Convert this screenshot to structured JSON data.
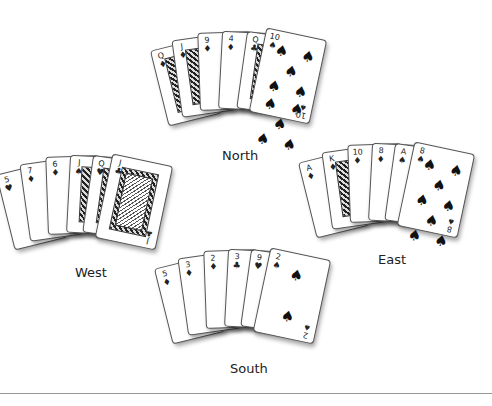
{
  "table": {
    "background": "#ffffff",
    "card_ink": "#111111"
  },
  "hands": [
    {
      "seat": "North",
      "label": "North",
      "cards": [
        {
          "rank": "Q",
          "suit": "♦",
          "suit_name": "diamonds"
        },
        {
          "rank": "J",
          "suit": "♦",
          "suit_name": "diamonds"
        },
        {
          "rank": "9",
          "suit": "♦",
          "suit_name": "diamonds"
        },
        {
          "rank": "4",
          "suit": "♦",
          "suit_name": "diamonds"
        },
        {
          "rank": "Q",
          "suit": "♣",
          "suit_name": "clubs"
        },
        {
          "rank": "10",
          "suit": "♠",
          "suit_name": "spades"
        }
      ]
    },
    {
      "seat": "West",
      "label": "West",
      "cards": [
        {
          "rank": "5",
          "suit": "♥",
          "suit_name": "hearts"
        },
        {
          "rank": "7",
          "suit": "♦",
          "suit_name": "diamonds"
        },
        {
          "rank": "6",
          "suit": "♦",
          "suit_name": "diamonds"
        },
        {
          "rank": "J",
          "suit": "♠",
          "suit_name": "spades"
        },
        {
          "rank": "Q",
          "suit": "♥",
          "suit_name": "hearts"
        },
        {
          "rank": "J",
          "suit": "♣",
          "suit_name": "clubs"
        }
      ]
    },
    {
      "seat": "East",
      "label": "East",
      "cards": [
        {
          "rank": "A",
          "suit": "♦",
          "suit_name": "diamonds"
        },
        {
          "rank": "K",
          "suit": "♦",
          "suit_name": "diamonds"
        },
        {
          "rank": "10",
          "suit": "♦",
          "suit_name": "diamonds"
        },
        {
          "rank": "8",
          "suit": "♦",
          "suit_name": "diamonds"
        },
        {
          "rank": "A",
          "suit": "♠",
          "suit_name": "spades"
        },
        {
          "rank": "8",
          "suit": "♠",
          "suit_name": "spades"
        }
      ]
    },
    {
      "seat": "South",
      "label": "South",
      "cards": [
        {
          "rank": "5",
          "suit": "♦",
          "suit_name": "diamonds"
        },
        {
          "rank": "3",
          "suit": "♦",
          "suit_name": "diamonds"
        },
        {
          "rank": "2",
          "suit": "♦",
          "suit_name": "diamonds"
        },
        {
          "rank": "3",
          "suit": "♣",
          "suit_name": "clubs"
        },
        {
          "rank": "9",
          "suit": "♥",
          "suit_name": "hearts"
        },
        {
          "rank": "2",
          "suit": "♠",
          "suit_name": "spades"
        }
      ]
    }
  ]
}
